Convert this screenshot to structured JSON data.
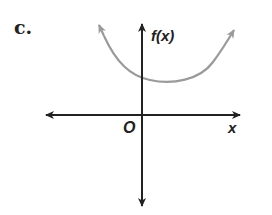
{
  "figure": {
    "part_label": "c.",
    "y_axis_label": "f(x)",
    "x_axis_label": "x",
    "origin_label": "O"
  },
  "colors": {
    "axes": "#222222",
    "curve": "#9a9a9a",
    "text": "#222222",
    "background": "#ffffff"
  },
  "graph": {
    "type": "parabola-like curve opening upward",
    "curve_description": "U-shaped curve with vertex slightly right of the y-axis, above the x-axis; both ends extend upward with arrows",
    "y_intercept": "positive",
    "x_intercepts": "none"
  }
}
